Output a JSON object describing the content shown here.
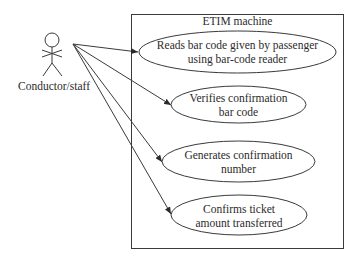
{
  "diagram": {
    "type": "uml-use-case",
    "system": {
      "title": "ETIM machine"
    },
    "actor": {
      "name": "Conductor/staff",
      "icon": "stick-figure-icon"
    },
    "use_cases": [
      {
        "line1": "Reads bar code given by passenger",
        "line2": "using bar-code reader"
      },
      {
        "line1": "Verifies confirmation",
        "line2": "bar code"
      },
      {
        "line1": "Generates confirmation",
        "line2": "number"
      },
      {
        "line1": "Confirms ticket",
        "line2": "amount transferred"
      }
    ],
    "associations": [
      {
        "from": "Conductor/staff",
        "to": "Reads bar code given by passenger using bar-code reader",
        "arrow": "open-to-use-case"
      },
      {
        "from": "Conductor/staff",
        "to": "Verifies confirmation bar code",
        "arrow": "open-to-use-case"
      },
      {
        "from": "Conductor/staff",
        "to": "Generates confirmation number",
        "arrow": "open-to-use-case"
      },
      {
        "from": "Conductor/staff",
        "to": "Confirms ticket amount transferred",
        "arrow": "open-to-use-case"
      }
    ]
  }
}
